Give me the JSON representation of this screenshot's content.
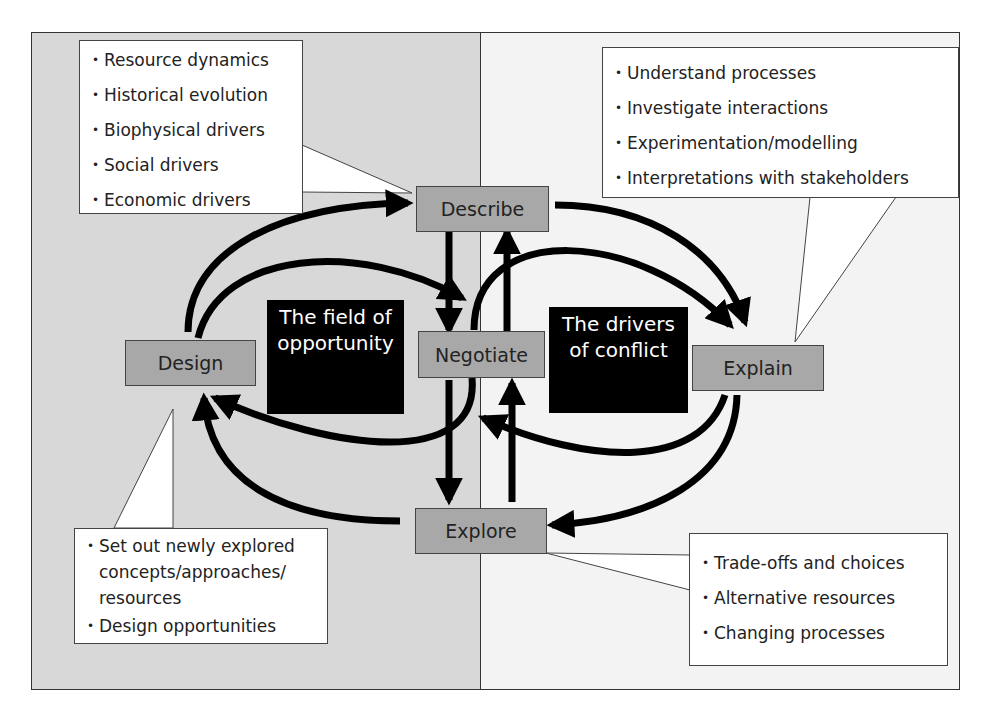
{
  "nodes": {
    "describe": "Describe",
    "design": "Design",
    "negotiate": "Negotiate",
    "explain": "Explain",
    "explore": "Explore"
  },
  "regions": {
    "left": "The field of opportunity",
    "left_line1": "The field of",
    "left_line2": "opportunity",
    "right": "The drivers of conflict",
    "right_line1": "The drivers",
    "right_line2": "of conflict"
  },
  "callouts": {
    "describe": [
      "Resource dynamics",
      "Historical evolution",
      "Biophysical drivers",
      "Social drivers",
      "Economic drivers"
    ],
    "explain": [
      "Understand processes",
      "Investigate interactions",
      "Experimentation/modelling",
      "Interpretations with stakeholders"
    ],
    "design": [
      "Set out newly explored concepts/approaches/ resources",
      "Design opportunities"
    ],
    "explore": [
      "Trade-offs and choices",
      "Alternative resources",
      "Changing processes"
    ]
  },
  "colors": {
    "left_background": "#d8d8d8",
    "right_background": "#f3f3f3",
    "node_fill": "#a8a8a8",
    "region_fill": "#000000",
    "arrow": "#000000"
  }
}
